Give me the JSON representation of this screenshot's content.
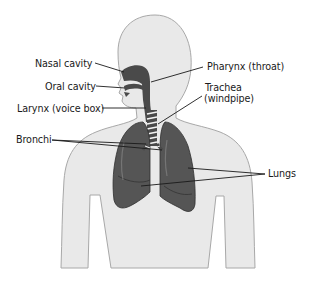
{
  "diagram": {
    "colors": {
      "body_fill": "#e9e9e9",
      "body_outline": "#a8a8a8",
      "lung_fill": "#555555",
      "lung_dark": "#3a3a3a",
      "airway_fill": "#4a4a4a",
      "trachea_rings": "#f2f2f2",
      "leader_line": "#1a1a1a",
      "label_text": "#1a1a1a",
      "background": "#ffffff"
    },
    "labels": {
      "nasal_cavity": "Nasal cavity",
      "oral_cavity": "Oral cavity",
      "larynx": "Larynx (voice box)",
      "bronchi": "Bronchi",
      "pharynx": "Pharynx (throat)",
      "trachea_line1": "Trachea",
      "trachea_line2": "(windpipe)",
      "lungs": "Lungs"
    }
  }
}
